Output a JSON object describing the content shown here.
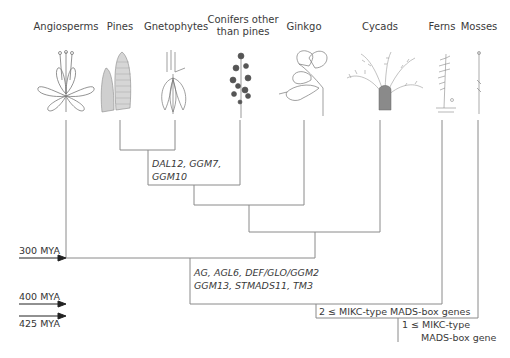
{
  "taxa": [
    {
      "name": "Angiosperms",
      "line1": "Angiosperms",
      "line2": ""
    },
    {
      "name": "Pines",
      "line1": "Pines",
      "line2": ""
    },
    {
      "name": "Gnetophytes",
      "line1": "Gnetophytes",
      "line2": ""
    },
    {
      "name": "Conifers other than pines",
      "line1": "Conifers other",
      "line2": "than pines"
    },
    {
      "name": "Ginkgo",
      "line1": "Ginkgo",
      "line2": ""
    },
    {
      "name": "Cycads",
      "line1": "Cycads",
      "line2": ""
    },
    {
      "name": "Ferns",
      "line1": "Ferns",
      "line2": ""
    },
    {
      "name": "Mosses",
      "line1": "Mosses",
      "line2": ""
    }
  ],
  "gene_annotations": {
    "gnetophytes_pines": {
      "line1": "DAL12, GGM7,",
      "line2": "GGM10"
    },
    "seed_plants": {
      "line1": "AG, AGL6, DEF/GLO/GGM2",
      "line2": "GGM13, STMADS11, TM3"
    }
  },
  "notes": {
    "vascular": "2 ≤ MIKC-type MADS-box genes",
    "land_plants_line1": "1 ≤  MIKC-type",
    "land_plants_line2": "MADS-box gene"
  },
  "timescale": {
    "t300": "300 MYA",
    "t400": "400 MYA",
    "t425": "425 MYA"
  },
  "colors": {
    "line": "#8a8a8a",
    "arrow": "#222222",
    "text": "#3a3a3a",
    "drawing": "#777777"
  }
}
